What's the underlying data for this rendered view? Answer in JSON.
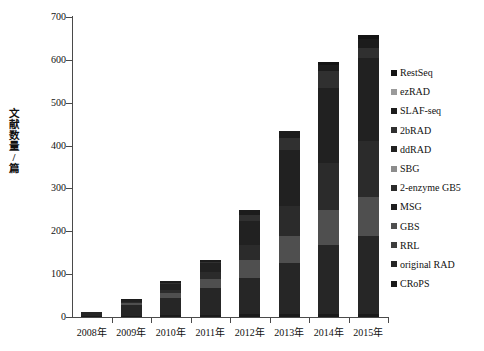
{
  "chart_data": {
    "type": "bar",
    "subtype": "stacked-bar",
    "title": "",
    "xlabel": "",
    "ylabel": "文献数量/篇",
    "ylim": [
      0,
      700
    ],
    "ytick_values": [
      0,
      100,
      200,
      300,
      400,
      500,
      600,
      700
    ],
    "ytick_labels": [
      "0",
      "100",
      "200",
      "300",
      "400",
      "500",
      "600",
      "700"
    ],
    "grid": false,
    "legend_position": "right",
    "categories": [
      "2008年",
      "2009年",
      "2010年",
      "2011年",
      "2012年",
      "2013年",
      "2014年",
      "2015年"
    ],
    "series": [
      {
        "name": "CRoPS",
        "color": "#1a1a1a",
        "values": [
          2,
          3,
          4,
          5,
          6,
          7,
          8,
          8
        ]
      },
      {
        "name": "original RAD",
        "color": "#262626",
        "values": [
          10,
          25,
          40,
          62,
          85,
          120,
          160,
          180
        ]
      },
      {
        "name": "RRL",
        "color": "#3d3d3d",
        "values": [
          0,
          0,
          0,
          0,
          0,
          0,
          0,
          0
        ]
      },
      {
        "name": "GBS",
        "color": "#4f4f4f",
        "values": [
          0,
          5,
          12,
          22,
          42,
          62,
          82,
          92
        ]
      },
      {
        "name": "MSG",
        "color": "#1f1f1f",
        "values": [
          0,
          0,
          0,
          0,
          0,
          0,
          0,
          0
        ]
      },
      {
        "name": "2-enzyme GB5",
        "color": "#2b2b2b",
        "values": [
          0,
          3,
          8,
          16,
          35,
          70,
          110,
          130
        ]
      },
      {
        "name": "SBG",
        "color": "#8c8c8c",
        "values": [
          0,
          0,
          0,
          0,
          0,
          0,
          0,
          0
        ]
      },
      {
        "name": "ddRAD",
        "color": "#212121",
        "values": [
          0,
          4,
          12,
          20,
          55,
          130,
          175,
          195
        ]
      },
      {
        "name": "2bRAD",
        "color": "#303030",
        "values": [
          0,
          0,
          4,
          4,
          14,
          28,
          38,
          22
        ]
      },
      {
        "name": "SLAF-seq",
        "color": "#1c1c1c",
        "values": [
          0,
          3,
          3,
          3,
          13,
          18,
          16,
          22
        ]
      },
      {
        "name": "ezRAD",
        "color": "#9a9a9a",
        "values": [
          0,
          0,
          0,
          0,
          0,
          0,
          0,
          0
        ]
      },
      {
        "name": "RestSeq",
        "color": "#141414",
        "values": [
          0,
          0,
          0,
          0,
          0,
          0,
          6,
          9
        ]
      }
    ],
    "totals": [
      12,
      43,
      83,
      132,
      250,
      435,
      595,
      658
    ]
  },
  "legend": {
    "items": [
      {
        "label": "RestSeq",
        "color": "#141414"
      },
      {
        "label": "ezRAD",
        "color": "#9a9a9a"
      },
      {
        "label": "SLAF-seq",
        "color": "#1c1c1c"
      },
      {
        "label": "2bRAD",
        "color": "#303030"
      },
      {
        "label": "ddRAD",
        "color": "#212121"
      },
      {
        "label": "SBG",
        "color": "#8c8c8c"
      },
      {
        "label": "2-enzyme GB5",
        "color": "#2b2b2b"
      },
      {
        "label": "MSG",
        "color": "#1f1f1f"
      },
      {
        "label": "GBS",
        "color": "#4f4f4f"
      },
      {
        "label": "RRL",
        "color": "#3d3d3d"
      },
      {
        "label": "original RAD",
        "color": "#262626"
      },
      {
        "label": "CRoPS",
        "color": "#1a1a1a"
      }
    ]
  },
  "axis": {
    "y_label_chars": [
      "文",
      "献",
      "数",
      "量",
      "/",
      "篇"
    ]
  }
}
